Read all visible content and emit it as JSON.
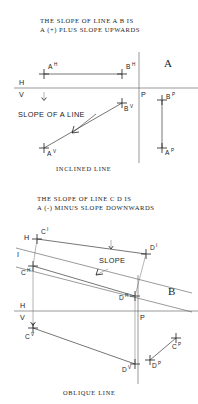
{
  "plate": {
    "background_color": "#ffffff",
    "ink_color": "#1d1d1d",
    "reference_line_color": "#555555"
  },
  "figures": [
    {
      "id": "figure-a",
      "plate_label": "A",
      "title_lines": [
        "THE SLOPE OF LINE A B IS",
        "A (+) PLUS SLOPE UPWARDS"
      ],
      "caption": "INCLINED LINE",
      "annotation": "SLOPE OF A LINE",
      "fold_labels": {
        "upper": "H",
        "lower": "V",
        "profile": "P"
      },
      "points": [
        {
          "name": "A",
          "view": "H",
          "label": "A",
          "superscript": "H"
        },
        {
          "name": "B",
          "view": "H",
          "label": "B",
          "superscript": "H"
        },
        {
          "name": "B",
          "view": "V",
          "label": "B",
          "superscript": "V"
        },
        {
          "name": "A",
          "view": "V",
          "label": "A",
          "superscript": "V"
        },
        {
          "name": "B",
          "view": "P",
          "label": "B",
          "superscript": "P"
        },
        {
          "name": "A",
          "view": "P",
          "label": "A",
          "superscript": "P"
        }
      ]
    },
    {
      "id": "figure-b",
      "plate_label": "B",
      "title_lines": [
        "THE SLOPE OF LINE C D IS",
        "A (-) MINUS SLOPE DOWNWARDS"
      ],
      "caption": "OBLIQUE LINE",
      "annotation": "SLOPE",
      "fold_labels": {
        "aux_upper": "H",
        "aux_lower": "I",
        "upper": "H",
        "lower": "V",
        "profile": "P"
      },
      "points": [
        {
          "name": "C",
          "view": "I",
          "label": "C",
          "superscript": "I"
        },
        {
          "name": "D",
          "view": "I",
          "label": "D",
          "superscript": "I"
        },
        {
          "name": "C",
          "view": "H",
          "label": "C",
          "superscript": "H"
        },
        {
          "name": "D",
          "view": "H",
          "label": "D",
          "superscript": "H"
        },
        {
          "name": "C",
          "view": "V",
          "label": "C",
          "superscript": "V"
        },
        {
          "name": "D",
          "view": "V",
          "label": "D",
          "superscript": "V"
        },
        {
          "name": "D",
          "view": "P",
          "label": "D",
          "superscript": "P"
        },
        {
          "name": "C",
          "view": "P",
          "label": "C",
          "superscript": "P"
        }
      ]
    }
  ]
}
